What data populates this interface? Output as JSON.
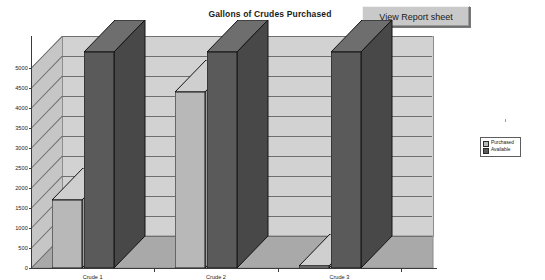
{
  "toolbar": {
    "view_report_label": "View Report sheet"
  },
  "chart_data": {
    "type": "bar",
    "title": "Gallons of Crudes Purchased",
    "xlabel": "",
    "ylabel": "",
    "categories": [
      "Crude 1",
      "Crude 2",
      "Crude 3"
    ],
    "series": [
      {
        "name": "Purchased",
        "values": [
          1700,
          4400,
          50
        ],
        "color": "#b8b8b8"
      },
      {
        "name": "Available",
        "values": [
          5400,
          5400,
          5400
        ],
        "color": "#5a5a5a"
      }
    ],
    "ylim": [
      0,
      5000
    ],
    "ytick_step": 500,
    "yticks": [
      0,
      500,
      1000,
      1500,
      2000,
      2500,
      3000,
      3500,
      4000,
      4500,
      5000
    ],
    "ytick_labels": [
      "0",
      "500",
      "1000",
      "1500",
      "2000",
      "2500",
      "3000",
      "3500",
      "4000",
      "4500",
      "5000"
    ],
    "grid": true,
    "three_d": true,
    "legend_position": "right",
    "plot_area_color": "#d2d2d2",
    "floor_color": "#a9a9a9"
  }
}
